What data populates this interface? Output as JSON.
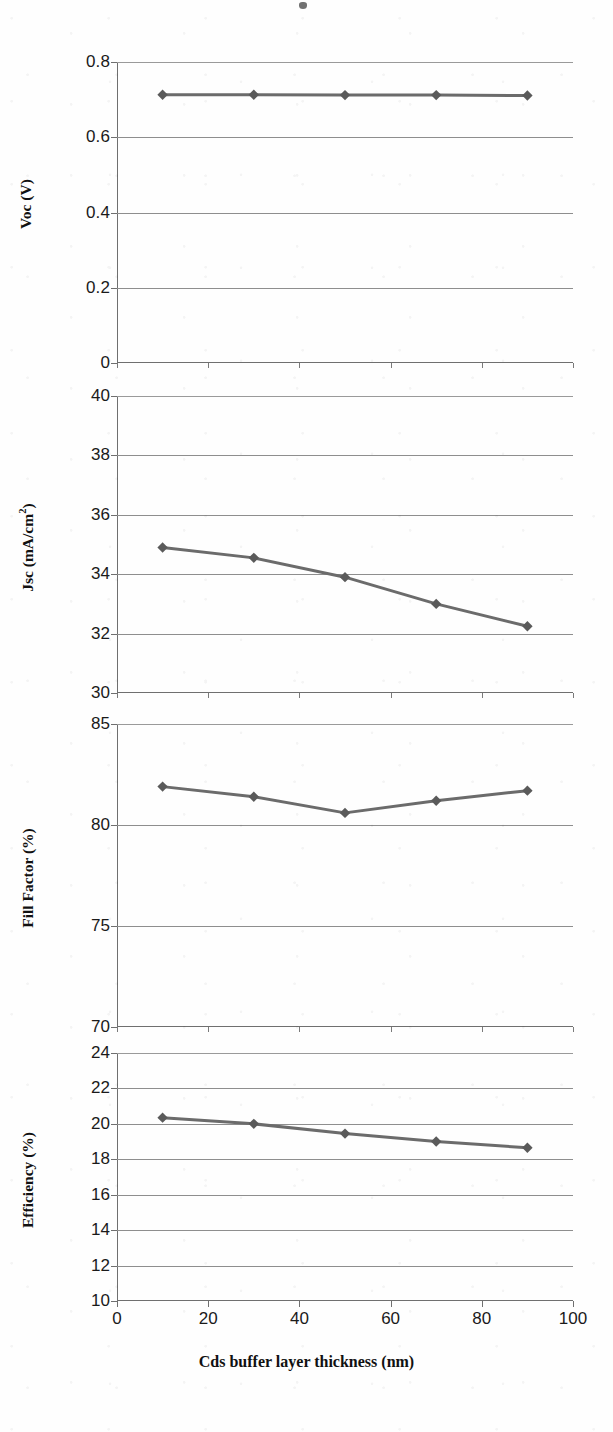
{
  "figure": {
    "x_axis_title": "Cds buffer layer thickness (nm)",
    "x_ticks": [
      "0",
      "20",
      "40",
      "60",
      "80",
      "100"
    ],
    "line_color": "#6b6b6b",
    "marker_color": "#5a5a5a",
    "grid_color": "#8e8e8e",
    "axis_color": "#6f6f6f"
  },
  "chart_data": [
    {
      "type": "line",
      "title": "",
      "xlabel": "Cds buffer layer thickness (nm)",
      "ylabel": "Voc (V)",
      "ylabel_html": "Voc (V)",
      "x": [
        10,
        30,
        50,
        70,
        90
      ],
      "values": [
        0.713,
        0.713,
        0.712,
        0.712,
        0.711
      ],
      "ylim": [
        0,
        0.8
      ],
      "yticks": [
        "0",
        "0.2",
        "0.4",
        "0.6",
        "0.8"
      ],
      "ytick_values": [
        0,
        0.2,
        0.4,
        0.6,
        0.8
      ],
      "xlim": [
        0,
        100
      ],
      "grid": true,
      "legend": "none",
      "marker": "diamond"
    },
    {
      "type": "line",
      "title": "",
      "xlabel": "Cds buffer layer thickness (nm)",
      "ylabel": "Jsc (mA/cm2)",
      "ylabel_html": "Jsc (mA/cm<sup>2</sup>)",
      "x": [
        10,
        30,
        50,
        70,
        90
      ],
      "values": [
        34.9,
        34.55,
        33.9,
        33.0,
        32.25
      ],
      "ylim": [
        30,
        40
      ],
      "yticks": [
        "30",
        "32",
        "34",
        "36",
        "38",
        "40"
      ],
      "ytick_values": [
        30,
        32,
        34,
        36,
        38,
        40
      ],
      "xlim": [
        0,
        100
      ],
      "grid": true,
      "legend": "none",
      "marker": "diamond"
    },
    {
      "type": "line",
      "title": "",
      "xlabel": "Cds buffer layer thickness (nm)",
      "ylabel": "Fill Factor (%)",
      "ylabel_html": "Fill Factor (%)",
      "x": [
        10,
        30,
        50,
        70,
        90
      ],
      "values": [
        81.9,
        81.4,
        80.6,
        81.2,
        81.7
      ],
      "ylim": [
        70,
        85
      ],
      "yticks": [
        "70",
        "75",
        "80",
        "85"
      ],
      "ytick_values": [
        70,
        75,
        80,
        85
      ],
      "xlim": [
        0,
        100
      ],
      "grid": true,
      "legend": "none",
      "marker": "diamond"
    },
    {
      "type": "line",
      "title": "",
      "xlabel": "Cds buffer layer thickness (nm)",
      "ylabel": "Efficiency (%)",
      "ylabel_html": "Efficiency (%)",
      "x": [
        10,
        30,
        50,
        70,
        90
      ],
      "values": [
        20.35,
        20.0,
        19.45,
        19.0,
        18.65
      ],
      "ylim": [
        10,
        24
      ],
      "yticks": [
        "10",
        "12",
        "14",
        "16",
        "18",
        "20",
        "22",
        "24"
      ],
      "ytick_values": [
        10,
        12,
        14,
        16,
        18,
        20,
        22,
        24
      ],
      "xlim": [
        0,
        100
      ],
      "grid": true,
      "legend": "none",
      "marker": "diamond"
    }
  ]
}
